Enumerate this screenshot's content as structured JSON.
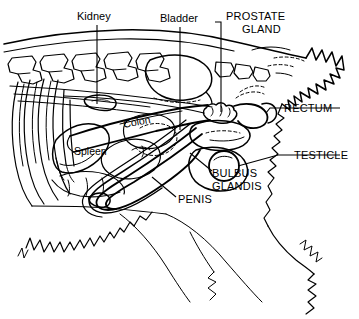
{
  "figure": {
    "style": "black line drawing on white background",
    "width": 359,
    "height": 319,
    "ink_color": "#000000",
    "background_color": "#ffffff"
  },
  "labels": {
    "kidney": "Kidney",
    "bladder": "Bladder",
    "prostate_line1": "PROSTATE",
    "prostate_line2": "GLAND",
    "rectum": "RECTUM",
    "testicle": "TESTICLE",
    "bulbus_line1": "BULBUS",
    "bulbus_line2": "GLANDIS",
    "penis": "PENIS",
    "colon": "Colon",
    "spleen": "Spleen"
  }
}
